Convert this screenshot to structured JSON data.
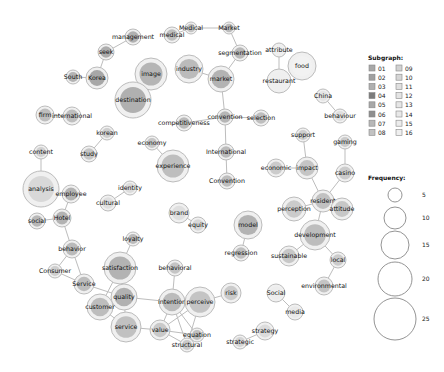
{
  "legend": {
    "subgraph_title": "Subgraph:",
    "subgraphs": [
      {
        "id": "01",
        "color": "#a8a8a8"
      },
      {
        "id": "02",
        "color": "#a0a0a0"
      },
      {
        "id": "03",
        "color": "#b0b0b0"
      },
      {
        "id": "04",
        "color": "#7c7c7c"
      },
      {
        "id": "05",
        "color": "#a8a8a8"
      },
      {
        "id": "06",
        "color": "#8f8f8f"
      },
      {
        "id": "07",
        "color": "#b8b8b8"
      },
      {
        "id": "08",
        "color": "#c2c2c2"
      },
      {
        "id": "09",
        "color": "#d2d2d2"
      },
      {
        "id": "10",
        "color": "#d6d6d6"
      },
      {
        "id": "11",
        "color": "#e0e0e0"
      },
      {
        "id": "12",
        "color": "#e4e4e4"
      },
      {
        "id": "13",
        "color": "#e6e6e6"
      },
      {
        "id": "14",
        "color": "#e8e8e8"
      },
      {
        "id": "15",
        "color": "#ececec"
      },
      {
        "id": "16",
        "color": "#efefef"
      }
    ],
    "frequency_title": "Frequency:",
    "frequencies": [
      {
        "label": "5",
        "r": 7
      },
      {
        "label": "10",
        "r": 11
      },
      {
        "label": "15",
        "r": 14
      },
      {
        "label": "20",
        "r": 17
      },
      {
        "label": "25",
        "r": 21
      }
    ]
  },
  "chart_data": {
    "type": "network",
    "title": "",
    "nodes": [
      {
        "id": "management",
        "x": 133,
        "y": 37,
        "r": 8,
        "fill": "#a5a5a5"
      },
      {
        "id": "medical",
        "x": 172,
        "y": 35,
        "r": 8,
        "fill": "#b5b5b5"
      },
      {
        "id": "Medical",
        "x": 191,
        "y": 28,
        "r": 6,
        "fill": "#bcbcbc"
      },
      {
        "id": "Market",
        "x": 229,
        "y": 28,
        "r": 6,
        "fill": "#b0b0b0"
      },
      {
        "id": "seek",
        "x": 106,
        "y": 52,
        "r": 8,
        "fill": "#a0a0a0"
      },
      {
        "id": "South",
        "x": 73,
        "y": 77,
        "r": 7,
        "fill": "#a8a8a8"
      },
      {
        "id": "Korea",
        "x": 97,
        "y": 78,
        "r": 11,
        "fill": "#9a9a9a"
      },
      {
        "id": "image",
        "x": 151,
        "y": 74,
        "r": 16,
        "fill": "#aaaaaa"
      },
      {
        "id": "destination",
        "x": 133,
        "y": 100,
        "r": 18,
        "fill": "#a4a4a4"
      },
      {
        "id": "industry",
        "x": 189,
        "y": 69,
        "r": 14,
        "fill": "#b2b2b2"
      },
      {
        "id": "market",
        "x": 221,
        "y": 79,
        "r": 13,
        "fill": "#a8a8a8"
      },
      {
        "id": "segmentation",
        "x": 240,
        "y": 53,
        "r": 8,
        "fill": "#aeaeae"
      },
      {
        "id": "attribute",
        "x": 279,
        "y": 50,
        "r": 7,
        "fill": "#eeeeee"
      },
      {
        "id": "food",
        "x": 302,
        "y": 66,
        "r": 14,
        "fill": "#f2f2f2"
      },
      {
        "id": "restaurant",
        "x": 279,
        "y": 81,
        "r": 12,
        "fill": "#efefef"
      },
      {
        "id": "China",
        "x": 323,
        "y": 96,
        "r": 7,
        "fill": "#e3e3e3"
      },
      {
        "id": "behaviour",
        "x": 340,
        "y": 116,
        "r": 7,
        "fill": "#dcdcdc"
      },
      {
        "id": "firm",
        "x": 45,
        "y": 115,
        "r": 9,
        "fill": "#b5b5b5"
      },
      {
        "id": "international",
        "x": 72,
        "y": 116,
        "r": 9,
        "fill": "#b5b5b5"
      },
      {
        "id": "convention",
        "x": 225,
        "y": 117,
        "r": 8,
        "fill": "#acacac"
      },
      {
        "id": "selection",
        "x": 261,
        "y": 118,
        "r": 8,
        "fill": "#b5b5b5"
      },
      {
        "id": "competitiveness",
        "x": 184,
        "y": 123,
        "r": 8,
        "fill": "#b0b0b0"
      },
      {
        "id": "korean",
        "x": 107,
        "y": 133,
        "r": 7,
        "fill": "#c8c8c8"
      },
      {
        "id": "study",
        "x": 89,
        "y": 154,
        "r": 8,
        "fill": "#bdbdbd"
      },
      {
        "id": "content",
        "x": 41,
        "y": 152,
        "r": 7,
        "fill": "#cbcbcb"
      },
      {
        "id": "economy",
        "x": 152,
        "y": 143,
        "r": 7,
        "fill": "#bebebe"
      },
      {
        "id": "International",
        "x": 226,
        "y": 152,
        "r": 8,
        "fill": "#b2b2b2"
      },
      {
        "id": "experience",
        "x": 173,
        "y": 166,
        "r": 16,
        "fill": "#b5b5b5"
      },
      {
        "id": "Convention",
        "x": 227,
        "y": 181,
        "r": 8,
        "fill": "#b4b4b4"
      },
      {
        "id": "support",
        "x": 303,
        "y": 135,
        "r": 7,
        "fill": "#c8c8c8"
      },
      {
        "id": "gaming",
        "x": 345,
        "y": 142,
        "r": 7,
        "fill": "#c4c4c4"
      },
      {
        "id": "economic",
        "x": 276,
        "y": 168,
        "r": 9,
        "fill": "#c4c4c4"
      },
      {
        "id": "impact",
        "x": 307,
        "y": 168,
        "r": 11,
        "fill": "#bdbdbd"
      },
      {
        "id": "casino",
        "x": 345,
        "y": 173,
        "r": 9,
        "fill": "#c6c6c6"
      },
      {
        "id": "analysis",
        "x": 41,
        "y": 189,
        "r": 18,
        "fill": "#d4d4d4"
      },
      {
        "id": "employee",
        "x": 71,
        "y": 194,
        "r": 9,
        "fill": "#a8a8a8"
      },
      {
        "id": "identity",
        "x": 130,
        "y": 188,
        "r": 7,
        "fill": "#d8d8d8"
      },
      {
        "id": "cultural",
        "x": 108,
        "y": 203,
        "r": 8,
        "fill": "#dcdcdc"
      },
      {
        "id": "resident",
        "x": 323,
        "y": 201,
        "r": 11,
        "fill": "#b8b8b8"
      },
      {
        "id": "perception",
        "x": 294,
        "y": 209,
        "r": 12,
        "fill": "#c4c4c4"
      },
      {
        "id": "attitude",
        "x": 342,
        "y": 209,
        "r": 11,
        "fill": "#c0c0c0"
      },
      {
        "id": "social",
        "x": 37,
        "y": 221,
        "r": 8,
        "fill": "#adadad"
      },
      {
        "id": "Hotel",
        "x": 62,
        "y": 218,
        "r": 9,
        "fill": "#a8a8a8"
      },
      {
        "id": "brand",
        "x": 179,
        "y": 213,
        "r": 10,
        "fill": "#dcdcdc"
      },
      {
        "id": "equity",
        "x": 198,
        "y": 225,
        "r": 8,
        "fill": "#d4d4d4"
      },
      {
        "id": "model",
        "x": 248,
        "y": 225,
        "r": 14,
        "fill": "#a8a8a8"
      },
      {
        "id": "development",
        "x": 315,
        "y": 235,
        "r": 15,
        "fill": "#b4b4b4"
      },
      {
        "id": "behavior",
        "x": 72,
        "y": 249,
        "r": 9,
        "fill": "#b0b0b0"
      },
      {
        "id": "loyalty",
        "x": 133,
        "y": 239,
        "r": 7,
        "fill": "#b2b2b2"
      },
      {
        "id": "sustainable",
        "x": 289,
        "y": 256,
        "r": 10,
        "fill": "#c0c0c0"
      },
      {
        "id": "local",
        "x": 338,
        "y": 260,
        "r": 8,
        "fill": "#c4c4c4"
      },
      {
        "id": "regression",
        "x": 241,
        "y": 253,
        "r": 8,
        "fill": "#b6b6b6"
      },
      {
        "id": "behavioral",
        "x": 175,
        "y": 268,
        "r": 8,
        "fill": "#bcbcbc"
      },
      {
        "id": "satisfaction",
        "x": 120,
        "y": 268,
        "r": 16,
        "fill": "#a8a8a8"
      },
      {
        "id": "Consumer",
        "x": 55,
        "y": 271,
        "r": 7,
        "fill": "#c8c8c8"
      },
      {
        "id": "Service",
        "x": 84,
        "y": 284,
        "r": 10,
        "fill": "#b4b4b4"
      },
      {
        "id": "environmental",
        "x": 324,
        "y": 286,
        "r": 9,
        "fill": "#bcbcbc"
      },
      {
        "id": "quality",
        "x": 124,
        "y": 297,
        "r": 13,
        "fill": "#a6a6a6"
      },
      {
        "id": "intention",
        "x": 172,
        "y": 302,
        "r": 13,
        "fill": "#b2b2b2"
      },
      {
        "id": "perceive",
        "x": 200,
        "y": 302,
        "r": 15,
        "fill": "#bcbcbc"
      },
      {
        "id": "risk",
        "x": 231,
        "y": 293,
        "r": 10,
        "fill": "#c4c4c4"
      },
      {
        "id": "Social",
        "x": 276,
        "y": 293,
        "r": 9,
        "fill": "#ececec"
      },
      {
        "id": "customer",
        "x": 100,
        "y": 307,
        "r": 13,
        "fill": "#b4b4b4"
      },
      {
        "id": "media",
        "x": 295,
        "y": 312,
        "r": 8,
        "fill": "#e8e8e8"
      },
      {
        "id": "service",
        "x": 126,
        "y": 327,
        "r": 15,
        "fill": "#b8b8b8"
      },
      {
        "id": "value",
        "x": 160,
        "y": 330,
        "r": 10,
        "fill": "#c2c2c2"
      },
      {
        "id": "strategy",
        "x": 265,
        "y": 331,
        "r": 9,
        "fill": "#d8d8d8"
      },
      {
        "id": "equation",
        "x": 197,
        "y": 335,
        "r": 7,
        "fill": "#b6b6b6"
      },
      {
        "id": "strategic",
        "x": 240,
        "y": 342,
        "r": 7,
        "fill": "#d0d0d0"
      },
      {
        "id": "structural",
        "x": 187,
        "y": 345,
        "r": 7,
        "fill": "#c2c2c2"
      }
    ],
    "edges": [
      [
        "management",
        "seek"
      ],
      [
        "seek",
        "Korea"
      ],
      [
        "South",
        "Korea"
      ],
      [
        "medical",
        "Medical"
      ],
      [
        "Medical",
        "Market"
      ],
      [
        "Market",
        "segmentation"
      ],
      [
        "segmentation",
        "market"
      ],
      [
        "market",
        "industry"
      ],
      [
        "market",
        "convention"
      ],
      [
        "attribute",
        "restaurant"
      ],
      [
        "China",
        "behaviour"
      ],
      [
        "firm",
        "international"
      ],
      [
        "image",
        "destination"
      ],
      [
        "convention",
        "selection"
      ],
      [
        "convention",
        "competitiveness"
      ],
      [
        "convention",
        "International"
      ],
      [
        "International",
        "Convention"
      ],
      [
        "korean",
        "study"
      ],
      [
        "economy",
        "experience"
      ],
      [
        "content",
        "analysis"
      ],
      [
        "identity",
        "cultural"
      ],
      [
        "support",
        "impact"
      ],
      [
        "economic",
        "impact"
      ],
      [
        "impact",
        "resident"
      ],
      [
        "gaming",
        "casino"
      ],
      [
        "casino",
        "resident"
      ],
      [
        "resident",
        "perception"
      ],
      [
        "resident",
        "attitude"
      ],
      [
        "resident",
        "development"
      ],
      [
        "development",
        "sustainable"
      ],
      [
        "development",
        "local"
      ],
      [
        "local",
        "environmental"
      ],
      [
        "model",
        "regression"
      ],
      [
        "brand",
        "equity"
      ],
      [
        "employee",
        "Hotel"
      ],
      [
        "social",
        "Hotel"
      ],
      [
        "Hotel",
        "behavior"
      ],
      [
        "behavior",
        "Consumer"
      ],
      [
        "behavior",
        "Service"
      ],
      [
        "Consumer",
        "Service"
      ],
      [
        "Service",
        "quality"
      ],
      [
        "loyalty",
        "satisfaction"
      ],
      [
        "satisfaction",
        "quality"
      ],
      [
        "satisfaction",
        "customer"
      ],
      [
        "quality",
        "customer"
      ],
      [
        "quality",
        "service"
      ],
      [
        "quality",
        "intention"
      ],
      [
        "behavioral",
        "intention"
      ],
      [
        "intention",
        "perceive"
      ],
      [
        "perceive",
        "risk"
      ],
      [
        "intention",
        "value"
      ],
      [
        "service",
        "value"
      ],
      [
        "value",
        "equation"
      ],
      [
        "value",
        "structural"
      ],
      [
        "intention",
        "equation"
      ],
      [
        "intention",
        "structural"
      ],
      [
        "perceive",
        "structural"
      ],
      [
        "perceive",
        "value"
      ],
      [
        "equation",
        "structural"
      ],
      [
        "Social",
        "media"
      ],
      [
        "strategy",
        "strategic"
      ],
      [
        "customer",
        "service"
      ]
    ],
    "labels": {
      "management": "management",
      "medical": "medical",
      "Medical": "Medical",
      "Market": "Market",
      "seek": "seek",
      "South": "South",
      "Korea": "Korea",
      "image": "image",
      "destination": "destination",
      "industry": "industry",
      "market": "market",
      "segmentation": "segmentation",
      "attribute": "attribute",
      "food": "food",
      "restaurant": "restaurant",
      "China": "China",
      "behaviour": "behaviour",
      "firm": "firm",
      "international": "international",
      "convention": "convention",
      "selection": "selection",
      "competitiveness": "competitiveness",
      "korean": "korean",
      "study": "study",
      "content": "content",
      "economy": "economy",
      "International": "International",
      "experience": "experience",
      "Convention": "Convention",
      "support": "support",
      "gaming": "gaming",
      "economic": "economic",
      "impact": "impact",
      "casino": "casino",
      "analysis": "analysis",
      "employee": "employee",
      "identity": "identity",
      "cultural": "cultural",
      "resident": "resident",
      "perception": "perception",
      "attitude": "attitude",
      "social": "social",
      "Hotel": "Hotel",
      "brand": "brand",
      "equity": "equity",
      "model": "model",
      "development": "development",
      "behavior": "behavior",
      "loyalty": "loyalty",
      "sustainable": "sustainable",
      "local": "local",
      "regression": "regression",
      "behavioral": "behavioral",
      "satisfaction": "satisfaction",
      "Consumer": "Consumer",
      "Service": "Service",
      "environmental": "environmental",
      "quality": "quality",
      "intention": "intention",
      "perceive": "perceive",
      "risk": "risk",
      "Social": "Social",
      "customer": "customer",
      "media": "media",
      "service": "service",
      "value": "value",
      "strategy": "strategy",
      "equation": "equation",
      "strategic": "strategic",
      "structural": "structural"
    }
  }
}
